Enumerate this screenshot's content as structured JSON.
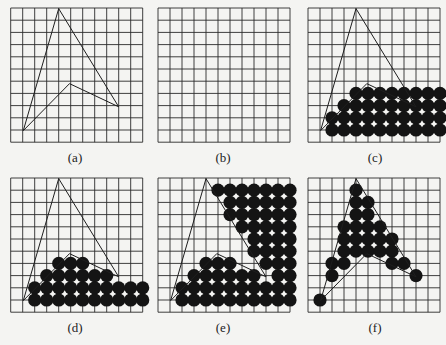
{
  "figure": {
    "grid": {
      "cols": 11,
      "rows": 11,
      "cell_w": 12,
      "cell_h": 12.2
    },
    "colors": {
      "background": "#f4f4f2",
      "grid": "#2a2a2a",
      "outline": "#1e1e1e",
      "dot": "#141414"
    },
    "polygon_note": "Arrow-head polygon; vertices in grid units (col,row) from top-left",
    "polygon": [
      [
        4.0,
        0.05
      ],
      [
        9.0,
        8.1
      ],
      [
        4.9,
        6.2
      ],
      [
        1.05,
        10.05
      ]
    ],
    "dot_radius": 6.6,
    "panels": [
      {
        "id": "a",
        "label": "(a)",
        "origin": [
          10.7,
          8
        ],
        "show_polygon": true,
        "dots": []
      },
      {
        "id": "b",
        "label": "(b)",
        "origin": [
          158,
          8
        ],
        "show_polygon": false,
        "dots": []
      },
      {
        "id": "c",
        "label": "(c)",
        "origin": [
          308,
          8
        ],
        "show_polygon": true,
        "dots": [
          {
            "row": 7,
            "cols": [
              4,
              5,
              6,
              7,
              8,
              9,
              10,
              11
            ]
          },
          {
            "row": 8,
            "cols": [
              3,
              4,
              5,
              6,
              7,
              8,
              9,
              10,
              11
            ]
          },
          {
            "row": 9,
            "cols": [
              2,
              3,
              4,
              5,
              6,
              7,
              8,
              9,
              10,
              11
            ]
          },
          {
            "row": 10,
            "cols": [
              2,
              3,
              4,
              5,
              6,
              7,
              8,
              9,
              10,
              11
            ]
          }
        ]
      },
      {
        "id": "d",
        "label": "(d)",
        "origin": [
          10.7,
          178
        ],
        "show_polygon": true,
        "dots": [
          {
            "row": 7,
            "cols": [
              4,
              5,
              6
            ]
          },
          {
            "row": 8,
            "cols": [
              3,
              4,
              5,
              6,
              7,
              8
            ]
          },
          {
            "row": 9,
            "cols": [
              2,
              3,
              4,
              5,
              6,
              7,
              8,
              9,
              10,
              11
            ]
          },
          {
            "row": 10,
            "cols": [
              2,
              3,
              4,
              5,
              6,
              7,
              8,
              9,
              10,
              11
            ]
          }
        ]
      },
      {
        "id": "e",
        "label": "(e)",
        "origin": [
          158,
          178
        ],
        "show_polygon": true,
        "dots": [
          {
            "row": 1,
            "cols": [
              5,
              6,
              7,
              8,
              9,
              10,
              11
            ]
          },
          {
            "row": 2,
            "cols": [
              6,
              7,
              8,
              9,
              10,
              11
            ]
          },
          {
            "row": 3,
            "cols": [
              6,
              7,
              8,
              9,
              10,
              11
            ]
          },
          {
            "row": 4,
            "cols": [
              7,
              8,
              9,
              10,
              11
            ]
          },
          {
            "row": 5,
            "cols": [
              8,
              9,
              10,
              11
            ]
          },
          {
            "row": 6,
            "cols": [
              8,
              9,
              10,
              11
            ]
          },
          {
            "row": 7,
            "cols": [
              4,
              5,
              6,
              9,
              10,
              11
            ]
          },
          {
            "row": 8,
            "cols": [
              3,
              4,
              5,
              6,
              7,
              8,
              10,
              11
            ]
          },
          {
            "row": 9,
            "cols": [
              2,
              3,
              4,
              5,
              6,
              7,
              8,
              9,
              10,
              11
            ]
          },
          {
            "row": 10,
            "cols": [
              2,
              3,
              4,
              5,
              6,
              7,
              8,
              9,
              10,
              11
            ]
          }
        ]
      },
      {
        "id": "f",
        "label": "(f)",
        "origin": [
          308,
          178
        ],
        "show_polygon": true,
        "dots": [
          {
            "row": 1,
            "cols": [
              4
            ]
          },
          {
            "row": 2,
            "cols": [
              4,
              5
            ]
          },
          {
            "row": 3,
            "cols": [
              4,
              5
            ]
          },
          {
            "row": 4,
            "cols": [
              3,
              4,
              5,
              6
            ]
          },
          {
            "row": 5,
            "cols": [
              3,
              4,
              5,
              6,
              7
            ]
          },
          {
            "row": 6,
            "cols": [
              3,
              4,
              5,
              6,
              7
            ]
          },
          {
            "row": 7,
            "cols": [
              2,
              3,
              7,
              8
            ]
          },
          {
            "row": 8,
            "cols": [
              2,
              9
            ]
          },
          {
            "row": 10,
            "cols": [
              1
            ]
          }
        ]
      }
    ]
  }
}
